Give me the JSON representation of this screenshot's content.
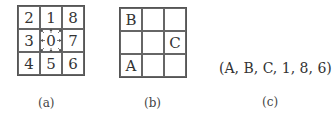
{
  "panel_a": {
    "cells": [
      "2",
      "1",
      "8",
      "3",
      "0",
      "7",
      "4",
      "5",
      "6"
    ],
    "caption": "(a)",
    "arrows": "from center cell 0 to all 8 neighbors"
  },
  "panel_b": {
    "cells": [
      "B",
      "",
      "",
      "",
      "",
      "C",
      "A",
      "",
      ""
    ],
    "caption": "(b)"
  },
  "panel_c": {
    "tuple": "(A, B, C, 1, 8, 6)",
    "caption": "(c)"
  }
}
